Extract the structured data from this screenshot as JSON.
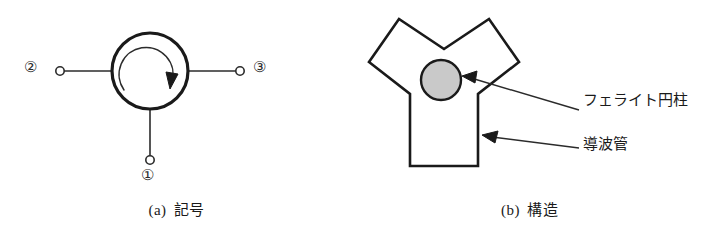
{
  "figure": {
    "panels": [
      {
        "id": "a",
        "caption_index": "(a)",
        "caption_text": "記号",
        "ports": [
          {
            "id": "1",
            "label": "①",
            "position": "bottom"
          },
          {
            "id": "2",
            "label": "②",
            "position": "left"
          },
          {
            "id": "3",
            "label": "③",
            "position": "right"
          }
        ],
        "symbol": {
          "shape": "circle",
          "inner_arrow": "clockwise-circular-arrow",
          "stroke_color": "#1a1a1a"
        }
      },
      {
        "id": "b",
        "caption_index": "(b)",
        "caption_text": "構造",
        "ports": [
          {
            "id": "1",
            "label": "①",
            "position": "bottom"
          },
          {
            "id": "2",
            "label": "②",
            "position": "upper-left"
          },
          {
            "id": "3",
            "label": "③",
            "position": "upper-right"
          }
        ],
        "annotations": [
          {
            "id": "ferrite",
            "label": "フェライト円柱",
            "points_to": "ferrite-cylinder"
          },
          {
            "id": "waveguide",
            "label": "導波管",
            "points_to": "waveguide-wall"
          }
        ],
        "ferrite_cylinder": {
          "fill_color": "#c9c9c9",
          "stroke_color": "#1a1a1a"
        },
        "waveguide": {
          "shape": "y-junction",
          "stroke_color": "#1a1a1a"
        }
      }
    ],
    "colors": {
      "ink": "#1a1a1a",
      "line": "#2b2b2b",
      "ferrite_fill": "#c9c9c9",
      "background": "#ffffff"
    }
  }
}
